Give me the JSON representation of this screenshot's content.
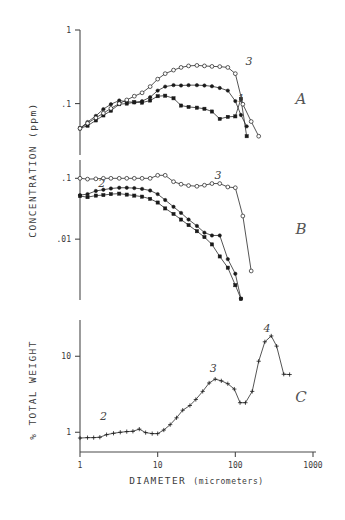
{
  "figure": {
    "width": 345,
    "height": 520,
    "background": "#ffffff",
    "ink_color": "#1a1a1a",
    "xlabel_main": "DIAMETER",
    "xlabel_paren": "(micrometers)",
    "panel_labels": [
      "A",
      "B",
      "C"
    ]
  },
  "chart_data": [
    {
      "type": "line",
      "panel": "A",
      "title": "",
      "xlabel": "DIAMETER (micrometers)",
      "ylabel": "CONCENTRATION (ppm)",
      "xscale": "log",
      "yscale": "log",
      "xlim": [
        1,
        1000
      ],
      "ylim": [
        0.02,
        1
      ],
      "xticks": [
        1,
        10,
        100,
        1000
      ],
      "xticklabels": [
        "1",
        "10",
        "100",
        "1000"
      ],
      "yticks": [
        1,
        0.1
      ],
      "yticklabels": [
        "1",
        ".1"
      ],
      "grid": false,
      "legend": "inline-curve-numbers",
      "annotations": [
        {
          "text": "3",
          "x": 150,
          "y": 0.33
        },
        {
          "text": "1",
          "x": 118,
          "y": 0.105
        },
        {
          "text": "A",
          "x": 700,
          "y": 0.1
        }
      ],
      "series": [
        {
          "name": "1",
          "marker": "filled-square",
          "points": [
            [
              1.0,
              0.046
            ],
            [
              1.25,
              0.05
            ],
            [
              1.6,
              0.059
            ],
            [
              2.0,
              0.069
            ],
            [
              2.5,
              0.08
            ],
            [
              3.2,
              0.098
            ],
            [
              4.0,
              0.1
            ],
            [
              5.0,
              0.104
            ],
            [
              6.3,
              0.103
            ],
            [
              8.0,
              0.11
            ],
            [
              10.0,
              0.126
            ],
            [
              12.5,
              0.128
            ],
            [
              16.0,
              0.118
            ],
            [
              20.0,
              0.094
            ],
            [
              25.0,
              0.09
            ],
            [
              32.0,
              0.088
            ],
            [
              40.0,
              0.085
            ],
            [
              50.0,
              0.078
            ],
            [
              63.0,
              0.062
            ],
            [
              80.0,
              0.066
            ],
            [
              100.0,
              0.067
            ],
            [
              118.0,
              0.116
            ],
            [
              140.0,
              0.036
            ]
          ]
        },
        {
          "name": "2",
          "marker": "filled-circle",
          "points": [
            [
              1.0,
              0.046
            ],
            [
              1.25,
              0.056
            ],
            [
              1.6,
              0.068
            ],
            [
              2.0,
              0.084
            ],
            [
              2.5,
              0.098
            ],
            [
              3.2,
              0.11
            ],
            [
              4.0,
              0.106
            ],
            [
              5.0,
              0.104
            ],
            [
              6.3,
              0.108
            ],
            [
              8.0,
              0.122
            ],
            [
              10.0,
              0.15
            ],
            [
              12.5,
              0.17
            ],
            [
              16.0,
              0.178
            ],
            [
              20.0,
              0.176
            ],
            [
              25.0,
              0.178
            ],
            [
              32.0,
              0.178
            ],
            [
              40.0,
              0.176
            ],
            [
              50.0,
              0.172
            ],
            [
              63.0,
              0.163
            ],
            [
              80.0,
              0.15
            ],
            [
              100.0,
              0.108
            ],
            [
              118.0,
              0.07
            ],
            [
              140.0,
              0.049
            ]
          ]
        },
        {
          "name": "3",
          "marker": "open-circle",
          "points": [
            [
              1.0,
              0.046
            ],
            [
              1.25,
              0.054
            ],
            [
              1.6,
              0.064
            ],
            [
              2.0,
              0.074
            ],
            [
              2.5,
              0.086
            ],
            [
              3.2,
              0.1
            ],
            [
              4.0,
              0.112
            ],
            [
              5.0,
              0.126
            ],
            [
              6.3,
              0.14
            ],
            [
              8.0,
              0.17
            ],
            [
              10.0,
              0.215
            ],
            [
              12.5,
              0.255
            ],
            [
              16.0,
              0.285
            ],
            [
              20.0,
              0.31
            ],
            [
              25.0,
              0.325
            ],
            [
              32.0,
              0.33
            ],
            [
              40.0,
              0.325
            ],
            [
              50.0,
              0.32
            ],
            [
              63.0,
              0.318
            ],
            [
              80.0,
              0.31
            ],
            [
              100.0,
              0.255
            ],
            [
              125.0,
              0.098
            ],
            [
              160.0,
              0.057
            ],
            [
              200.0,
              0.036
            ]
          ]
        }
      ]
    },
    {
      "type": "line",
      "panel": "B",
      "title": "",
      "xlabel": "DIAMETER (micrometers)",
      "ylabel": "CONCENTRATION (ppm)",
      "xscale": "log",
      "yscale": "log",
      "xlim": [
        1,
        1000
      ],
      "ylim": [
        0.001,
        0.2
      ],
      "yticks": [
        0.1,
        0.01
      ],
      "yticklabels": [
        ".1",
        ".01"
      ],
      "grid": false,
      "annotations": [
        {
          "text": "2",
          "x": 1.9,
          "y": 0.072
        },
        {
          "text": "3",
          "x": 60,
          "y": 0.098
        },
        {
          "text": "B",
          "x": 700,
          "y": 0.012
        }
      ],
      "series": [
        {
          "name": "1",
          "marker": "filled-square",
          "points": [
            [
              1.0,
              0.051
            ],
            [
              1.25,
              0.049
            ],
            [
              1.6,
              0.052
            ],
            [
              2.0,
              0.053
            ],
            [
              2.5,
              0.055
            ],
            [
              3.2,
              0.056
            ],
            [
              4.0,
              0.054
            ],
            [
              5.0,
              0.052
            ],
            [
              6.3,
              0.05
            ],
            [
              8.0,
              0.046
            ],
            [
              10.0,
              0.04
            ],
            [
              12.5,
              0.032
            ],
            [
              16.0,
              0.026
            ],
            [
              20.0,
              0.021
            ],
            [
              25.0,
              0.017
            ],
            [
              32.0,
              0.0135
            ],
            [
              40.0,
              0.0108
            ],
            [
              50.0,
              0.0082
            ],
            [
              63.0,
              0.0052
            ],
            [
              80.0,
              0.0034
            ],
            [
              100.0,
              0.00175
            ],
            [
              118.0,
              0.00105
            ]
          ]
        },
        {
          "name": "2",
          "marker": "filled-circle",
          "points": [
            [
              1.0,
              0.053
            ],
            [
              1.25,
              0.055
            ],
            [
              1.6,
              0.062
            ],
            [
              2.0,
              0.065
            ],
            [
              2.5,
              0.068
            ],
            [
              3.2,
              0.07
            ],
            [
              4.0,
              0.07
            ],
            [
              5.0,
              0.069
            ],
            [
              6.3,
              0.067
            ],
            [
              8.0,
              0.063
            ],
            [
              10.0,
              0.055
            ],
            [
              12.5,
              0.044
            ],
            [
              16.0,
              0.034
            ],
            [
              20.0,
              0.027
            ],
            [
              25.0,
              0.021
            ],
            [
              32.0,
              0.0165
            ],
            [
              40.0,
              0.0128
            ],
            [
              50.0,
              0.0115
            ],
            [
              63.0,
              0.0115
            ],
            [
              80.0,
              0.0047
            ],
            [
              100.0,
              0.0027
            ],
            [
              118.0,
              0.00105
            ]
          ]
        },
        {
          "name": "3",
          "marker": "open-circle",
          "points": [
            [
              1.0,
              0.1
            ],
            [
              1.25,
              0.097
            ],
            [
              1.6,
              0.098
            ],
            [
              2.0,
              0.1
            ],
            [
              2.5,
              0.1
            ],
            [
              3.2,
              0.1
            ],
            [
              4.0,
              0.1
            ],
            [
              5.0,
              0.1
            ],
            [
              6.3,
              0.1
            ],
            [
              8.0,
              0.1
            ],
            [
              10.0,
              0.112
            ],
            [
              12.5,
              0.112
            ],
            [
              16.0,
              0.088
            ],
            [
              20.0,
              0.08
            ],
            [
              25.0,
              0.076
            ],
            [
              32.0,
              0.074
            ],
            [
              40.0,
              0.077
            ],
            [
              50.0,
              0.082
            ],
            [
              63.0,
              0.082
            ],
            [
              80.0,
              0.072
            ],
            [
              100.0,
              0.07
            ],
            [
              125.0,
              0.024
            ],
            [
              160.0,
              0.003
            ]
          ]
        }
      ]
    },
    {
      "type": "line",
      "panel": "C",
      "title": "",
      "xlabel": "DIAMETER (micrometers)",
      "ylabel": "% TOTAL WEIGHT",
      "xscale": "log",
      "yscale": "log",
      "xlim": [
        1,
        1000
      ],
      "ylim": [
        0.55,
        30
      ],
      "xticks": [
        1,
        10,
        100,
        1000
      ],
      "xticklabels": [
        "1",
        "10",
        "100",
        "1000"
      ],
      "yticks": [
        10,
        1
      ],
      "yticklabels": [
        "10",
        "1"
      ],
      "grid": false,
      "annotations": [
        {
          "text": "2",
          "x": 2.0,
          "y": 1.45
        },
        {
          "text": "3",
          "x": 52,
          "y": 6.3
        },
        {
          "text": "4",
          "x": 255,
          "y": 21.0
        },
        {
          "text": "C",
          "x": 700,
          "y": 2.5
        }
      ],
      "series": [
        {
          "name": "total",
          "marker": "plus",
          "points": [
            [
              1.0,
              0.84
            ],
            [
              1.25,
              0.85
            ],
            [
              1.5,
              0.85
            ],
            [
              1.8,
              0.86
            ],
            [
              2.2,
              0.93
            ],
            [
              2.7,
              0.97
            ],
            [
              3.3,
              1.0
            ],
            [
              4.0,
              1.02
            ],
            [
              4.8,
              1.03
            ],
            [
              5.8,
              1.1
            ],
            [
              7.0,
              0.99
            ],
            [
              8.5,
              0.96
            ],
            [
              10.0,
              0.96
            ],
            [
              12.0,
              1.07
            ],
            [
              14.5,
              1.26
            ],
            [
              17.5,
              1.55
            ],
            [
              21.0,
              1.95
            ],
            [
              26.0,
              2.25
            ],
            [
              31.0,
              2.7
            ],
            [
              38.0,
              3.45
            ],
            [
              46.0,
              4.45
            ],
            [
              55.0,
              5.0
            ],
            [
              66.0,
              4.75
            ],
            [
              80.0,
              4.35
            ],
            [
              97.0,
              3.7
            ],
            [
              115.0,
              2.45
            ],
            [
              135.0,
              2.45
            ],
            [
              165.0,
              3.45
            ],
            [
              200.0,
              8.6
            ],
            [
              240.0,
              15.5
            ],
            [
              290.0,
              18.5
            ],
            [
              340.0,
              13.6
            ],
            [
              420.0,
              5.8
            ],
            [
              500.0,
              5.75
            ]
          ]
        }
      ]
    }
  ],
  "axes": {
    "ylabel_top": "CONCENTRATION (ppm)",
    "ylabel_bottom": "% TOTAL WEIGHT",
    "panelA_yticks": [
      "1",
      ".1"
    ],
    "panelB_yticks": [
      ".1",
      ".01"
    ],
    "panelC_yticks": [
      "10",
      "1"
    ],
    "xticks": [
      "1",
      "10",
      "100",
      "1000"
    ]
  }
}
